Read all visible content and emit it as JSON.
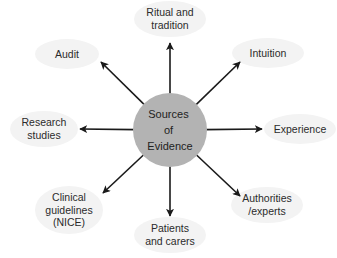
{
  "diagram": {
    "type": "radial",
    "center": {
      "lines": [
        "Sources",
        "of",
        "Evidence"
      ],
      "x": 170,
      "y": 130,
      "radius": 37,
      "fill": "#b3b3b3"
    },
    "arrow_color": "#1a1a1a",
    "node_fill": "#f3f3f3",
    "nodes": [
      {
        "id": "ritual",
        "lines": [
          "Ritual and",
          "tradition"
        ],
        "label_x": 170,
        "label_y": 19,
        "ellipse_rx": 36,
        "ellipse_ry": 18,
        "arrow_end": [
          170,
          43
        ]
      },
      {
        "id": "intuition",
        "lines": [
          "Intuition"
        ],
        "label_x": 268,
        "label_y": 53,
        "ellipse_rx": 36,
        "ellipse_ry": 15,
        "arrow_end": [
          240,
          62
        ]
      },
      {
        "id": "experience",
        "lines": [
          "Experience"
        ],
        "label_x": 300,
        "label_y": 129,
        "ellipse_rx": 36,
        "ellipse_ry": 15,
        "arrow_end": [
          262,
          129
        ]
      },
      {
        "id": "authorities",
        "lines": [
          "Authorities",
          "/experts"
        ],
        "label_x": 267,
        "label_y": 205,
        "ellipse_rx": 36,
        "ellipse_ry": 18,
        "arrow_end": [
          240,
          196
        ]
      },
      {
        "id": "patients",
        "lines": [
          "Patients",
          "and carers"
        ],
        "label_x": 170,
        "label_y": 235,
        "ellipse_rx": 36,
        "ellipse_ry": 18,
        "arrow_end": [
          170,
          216
        ]
      },
      {
        "id": "clinical",
        "lines": [
          "Clinical",
          "guidelines",
          "(NICE)"
        ],
        "label_x": 69,
        "label_y": 210,
        "ellipse_rx": 34,
        "ellipse_ry": 24,
        "arrow_end": [
          103,
          193
        ]
      },
      {
        "id": "research",
        "lines": [
          "Research",
          "studies"
        ],
        "label_x": 44,
        "label_y": 129,
        "ellipse_rx": 34,
        "ellipse_ry": 18,
        "arrow_end": [
          80,
          129
        ]
      },
      {
        "id": "audit",
        "lines": [
          "Audit"
        ],
        "label_x": 67,
        "label_y": 54,
        "ellipse_rx": 32,
        "ellipse_ry": 15,
        "arrow_end": [
          101,
          62
        ]
      }
    ]
  }
}
